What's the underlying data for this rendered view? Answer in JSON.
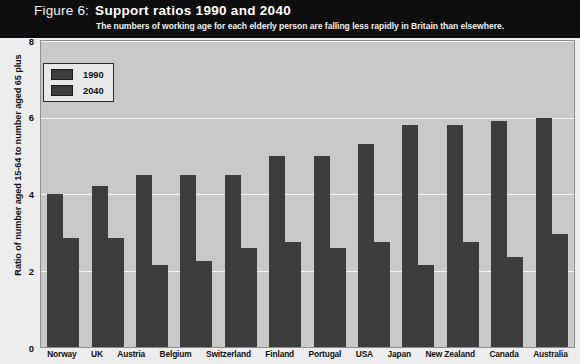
{
  "header": {
    "figure_label": "Figure 6:",
    "title": "Support ratios 1990 and 2040",
    "subtitle": "The numbers of working age for each elderly person are falling less rapidly in Britain than elsewhere."
  },
  "legend": {
    "items": [
      {
        "label": "1990",
        "color": "#3d3d3d"
      },
      {
        "label": "2040",
        "color": "#3d3d3d"
      }
    ]
  },
  "axes": {
    "ylabel": "Ratio of number aged 15-64 to number aged 65 plus",
    "yticks": [
      "0",
      "2",
      "4",
      "6",
      "8"
    ],
    "xlabel": ""
  },
  "colors": {
    "header_background": "#0d0d0d",
    "header_text": "#ffffff",
    "plot_background": "#c9c9c9",
    "gridline": "#f4f4f4",
    "bar": "#3d3d3d",
    "page_background": "#ededed"
  },
  "chart_data": {
    "type": "bar",
    "title": "Support ratios 1990 and 2040",
    "subtitle": "The numbers of working age for each elderly person are falling less rapidly in Britain than elsewhere.",
    "xlabel": "",
    "ylabel": "Ratio of number aged 15-64 to number aged 65 plus",
    "ylim": [
      0,
      8
    ],
    "yticks": [
      0,
      2,
      4,
      6,
      8
    ],
    "grid": true,
    "legend_position": "top-left",
    "categories": [
      "Norway",
      "UK",
      "Austria",
      "Belgium",
      "Switzerland",
      "Finland",
      "Portugal",
      "USA",
      "Japan",
      "New Zealand",
      "Canada",
      "Australia"
    ],
    "series": [
      {
        "name": "1990",
        "color": "#3d3d3d",
        "values": [
          4.0,
          4.2,
          4.5,
          4.5,
          4.5,
          5.0,
          5.0,
          5.3,
          5.8,
          5.8,
          5.9,
          6.0
        ]
      },
      {
        "name": "2040",
        "color": "#3d3d3d",
        "values": [
          2.85,
          2.85,
          2.15,
          2.25,
          2.6,
          2.75,
          2.6,
          2.75,
          2.15,
          2.75,
          2.35,
          2.95
        ]
      }
    ]
  }
}
